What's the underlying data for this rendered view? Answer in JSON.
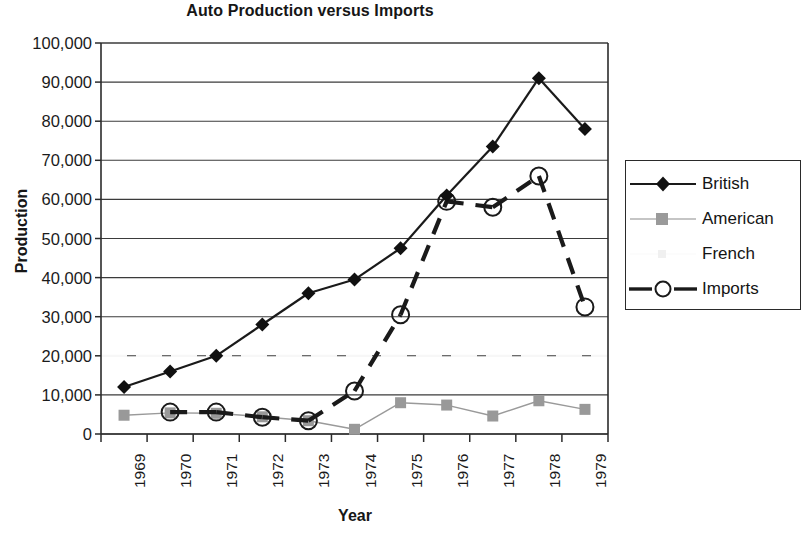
{
  "chart_data": {
    "type": "line",
    "title": "Auto Production versus Imports",
    "xlabel": "Year",
    "ylabel": "Production",
    "categories": [
      "1969",
      "1970",
      "1971",
      "1972",
      "1973",
      "1974",
      "1975",
      "1976",
      "1977",
      "1978",
      "1979"
    ],
    "ylim": [
      0,
      100000
    ],
    "ytick_step": 10000,
    "ytick_labels": [
      "0",
      "10,000",
      "20,000",
      "30,000",
      "40,000",
      "50,000",
      "60,000",
      "70,000",
      "80,000",
      "90,000",
      "100,000"
    ],
    "ytick_values": [
      0,
      10000,
      20000,
      30000,
      40000,
      50000,
      60000,
      70000,
      80000,
      90000,
      100000
    ],
    "grid": true,
    "legend_position": "right",
    "series": [
      {
        "name": "British",
        "color": "#1a1a1a",
        "marker": "diamond",
        "line": "solid",
        "values": [
          12000,
          16000,
          20000,
          28000,
          36000,
          39500,
          47500,
          61000,
          73500,
          91000,
          78000
        ]
      },
      {
        "name": "American",
        "color": "#9a9a9a",
        "marker": "square",
        "line": "solid",
        "values": [
          4800,
          5400,
          5300,
          4400,
          3400,
          1200,
          8000,
          7400,
          4600,
          8500,
          6300
        ]
      },
      {
        "name": "French",
        "color": "#f2f2f2",
        "marker": "dot",
        "line": "faint",
        "values": [
          null,
          null,
          null,
          null,
          null,
          null,
          null,
          null,
          null,
          null,
          null
        ]
      },
      {
        "name": "Imports",
        "color": "#1a1a1a",
        "marker": "circle-open",
        "line": "dashed",
        "values": [
          null,
          5600,
          5600,
          4300,
          3400,
          11000,
          30500,
          59500,
          58000,
          66000,
          32500
        ]
      }
    ]
  },
  "legend": {
    "entries": [
      {
        "label": "British"
      },
      {
        "label": "American"
      },
      {
        "label": "French"
      },
      {
        "label": "Imports"
      }
    ]
  }
}
